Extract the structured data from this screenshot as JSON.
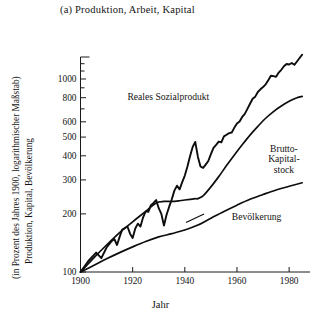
{
  "figure": {
    "title": "(a) Produktion, Arbeit, Kapital",
    "ylabel_line1": "Produktion, Kapital, Bevölkerung",
    "ylabel_line2": "(in Prozent des Jahres 1900, logarithmischer Maßstab)",
    "xlabel": "Jahr"
  },
  "chart_data": {
    "type": "line",
    "title": "(a) Produktion, Arbeit, Kapital",
    "xlabel": "Jahr",
    "ylabel": "Produktion, Kapital, Bevölkerung (in Prozent des Jahres 1900, logarithmischer Maßstab)",
    "yscale": "log",
    "xlim": [
      1900,
      1988
    ],
    "ylim": [
      100,
      1300
    ],
    "grid": false,
    "legend": "inline-annotations",
    "xticks": [
      1900,
      1920,
      1940,
      1960,
      1980
    ],
    "xtick_labels": [
      "1900",
      "1920",
      "1940",
      "1960",
      "1980"
    ],
    "yticks": [
      100,
      200,
      300,
      400,
      500,
      600,
      800,
      1000
    ],
    "ytick_labels": [
      "100",
      "200",
      "300",
      "400",
      "500",
      "600",
      "800",
      "1000"
    ],
    "yticks_minor": [
      700,
      900,
      1100,
      1200
    ],
    "series": [
      {
        "name": "Reales Sozialprodukt",
        "label": "Reales Sozialprodukt",
        "x": [
          1900,
          1903,
          1906,
          1908,
          1910,
          1912,
          1913,
          1914,
          1915,
          1916,
          1918,
          1919,
          1920,
          1921,
          1922,
          1923,
          1924,
          1925,
          1926,
          1927,
          1928,
          1929,
          1930,
          1931,
          1932,
          1933,
          1934,
          1935,
          1936,
          1937,
          1938,
          1939,
          1940,
          1941,
          1942,
          1943,
          1944,
          1945,
          1946,
          1947,
          1948,
          1949,
          1950,
          1951,
          1952,
          1953,
          1954,
          1955,
          1956,
          1957,
          1958,
          1959,
          1960,
          1961,
          1962,
          1963,
          1964,
          1965,
          1966,
          1967,
          1968,
          1969,
          1970,
          1971,
          1972,
          1973,
          1974,
          1975,
          1976,
          1977,
          1978,
          1979,
          1980,
          1981,
          1982,
          1983,
          1984,
          1985
        ],
        "y": [
          100,
          114,
          126,
          118,
          134,
          145,
          148,
          138,
          152,
          166,
          172,
          158,
          150,
          168,
          178,
          172,
          192,
          206,
          205,
          222,
          228,
          236,
          214,
          200,
          174,
          198,
          218,
          238,
          264,
          280,
          268,
          292,
          316,
          352,
          398,
          444,
          472,
          396,
          352,
          346,
          360,
          376,
          408,
          440,
          456,
          474,
          470,
          504,
          514,
          524,
          528,
          560,
          588,
          602,
          636,
          660,
          700,
          744,
          790,
          810,
          856,
          884,
          908,
          938,
          986,
          1040,
          1034,
          1026,
          1080,
          1116,
          1164,
          1196,
          1188,
          1210,
          1184,
          1232,
          1284,
          1336
        ],
        "annotation_xy": [
          1918,
          780
        ]
      },
      {
        "name": "Brutto-Kapitalstock",
        "label": "Brutto-Kapital-stock",
        "label_lines": [
          "Brutto-",
          "Kapital-",
          "stock"
        ],
        "x": [
          1900,
          1905,
          1910,
          1915,
          1920,
          1925,
          1929,
          1932,
          1935,
          1938,
          1940,
          1942,
          1944,
          1945,
          1947,
          1950,
          1953,
          1956,
          1959,
          1962,
          1965,
          1968,
          1971,
          1974,
          1977,
          1980,
          1983,
          1985
        ],
        "y": [
          100,
          118,
          138,
          160,
          182,
          206,
          228,
          232,
          232,
          234,
          236,
          238,
          240,
          240,
          248,
          276,
          312,
          356,
          404,
          456,
          512,
          568,
          626,
          678,
          724,
          766,
          800,
          812
        ],
        "annotation_xy": [
          1978,
          420
        ]
      },
      {
        "name": "Bevölkerung",
        "label": "Bevölkerung",
        "x": [
          1900,
          1905,
          1910,
          1915,
          1920,
          1925,
          1930,
          1935,
          1940,
          1945,
          1950,
          1955,
          1960,
          1965,
          1970,
          1975,
          1980,
          1985
        ],
        "y": [
          100,
          108,
          117,
          126,
          135,
          144,
          152,
          158,
          165,
          175,
          190,
          206,
          222,
          238,
          252,
          266,
          278,
          290
        ],
        "annotation_xy": [
          1958,
          185
        ]
      }
    ]
  }
}
